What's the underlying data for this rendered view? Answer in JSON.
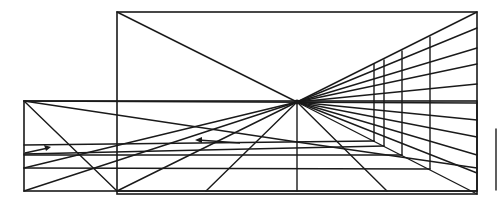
{
  "diagram": {
    "title": "",
    "vanishing_point": {
      "x": 297,
      "y": 102
    },
    "back_rectangle": {
      "x1": 117,
      "y1": 12,
      "x2": 477,
      "y2": 194
    },
    "front_rectangle": {
      "x1": 24,
      "y1": 101,
      "x2": 477,
      "y2": 191
    },
    "floor_horizontals_y": [
      145,
      154,
      168
    ],
    "right_wall_verticals": [
      {
        "x": 374,
        "y1": 64,
        "y2": 141
      },
      {
        "x": 384,
        "y1": 60,
        "y2": 146
      },
      {
        "x": 402,
        "y1": 51,
        "y2": 155
      },
      {
        "x": 430,
        "y1": 37,
        "y2": 169
      }
    ],
    "right_wall_rays_end_y": [
      12,
      28,
      48,
      64,
      84,
      103,
      120,
      137,
      155,
      173,
      194
    ],
    "arrows": [
      {
        "direction": "right",
        "x1": 25,
        "y1": 153,
        "x2": 50,
        "y2": 147
      },
      {
        "direction": "left",
        "x1": 240,
        "y1": 143,
        "x2": 195,
        "y2": 140
      }
    ],
    "side_tick": {
      "x": 496,
      "y1": 129,
      "y2": 190
    }
  }
}
